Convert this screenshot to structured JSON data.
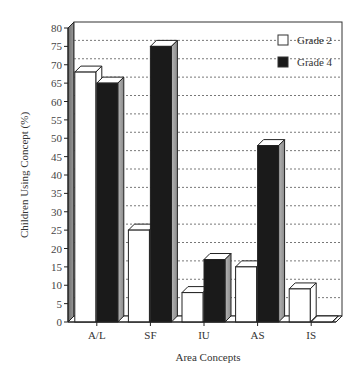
{
  "chart_data": {
    "type": "bar",
    "style": "3d-clustered",
    "title": "",
    "xlabel": "Area Concepts",
    "ylabel": "Children Using Concept (%)",
    "ylim": [
      0,
      80
    ],
    "yticks": [
      0,
      5,
      10,
      15,
      20,
      25,
      30,
      35,
      40,
      45,
      50,
      55,
      60,
      65,
      70,
      75,
      80
    ],
    "grid": "horizontal dotted",
    "legend_position": "upper right inside",
    "categories": [
      "A/L",
      "SF",
      "IU",
      "AS",
      "IS"
    ],
    "series": [
      {
        "name": "Grade 2",
        "color": "#ffffff",
        "values": [
          68,
          25,
          8,
          15,
          9
        ]
      },
      {
        "name": "Grade 4",
        "color": "#1a1a1a",
        "values": [
          65,
          75,
          17,
          48,
          0
        ]
      }
    ]
  },
  "legend": {
    "items": [
      {
        "label": "Grade 2",
        "color": "#ffffff"
      },
      {
        "label": "Grade 4",
        "color": "#1a1a1a"
      }
    ]
  },
  "axes": {
    "x_title": "Area Concepts",
    "y_title": "Children Using Concept (%)"
  }
}
